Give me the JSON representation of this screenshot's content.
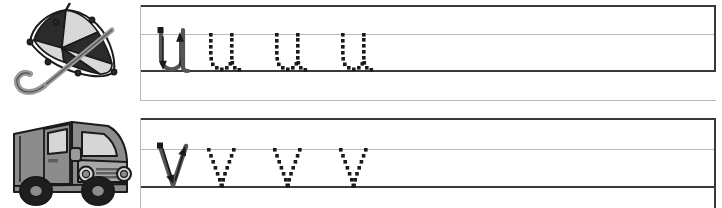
{
  "worksheet": {
    "title": "Lowercase letter tracing practice",
    "rows": [
      {
        "id": "row-u",
        "letter": "u",
        "picture": {
          "name": "umbrella",
          "label": "umbrella",
          "colors": {
            "panel_dark": "#2b2b2b",
            "panel_light": "#d8d8d8",
            "outline": "#1a1a1a",
            "handle": "#9a9a9a"
          }
        },
        "model_glyph": {
          "letter": "u",
          "style": "solid-with-stroke-arrows",
          "stroke_count": 2
        },
        "trace_glyphs": [
          {
            "letter": "u",
            "style": "dotted"
          },
          {
            "letter": "u",
            "style": "dotted"
          },
          {
            "letter": "u",
            "style": "dotted"
          }
        ],
        "rules": {
          "top": "solid-dark",
          "middle": "light-guide",
          "baseline": "solid-dark",
          "bottom": "light-guide"
        }
      },
      {
        "id": "row-v",
        "letter": "v",
        "picture": {
          "name": "van",
          "label": "van",
          "colors": {
            "body": "#8c8c8c",
            "body_light": "#a8a8a8",
            "window": "#d6d6d6",
            "outline": "#1a1a1a",
            "tire": "#1e1e1e",
            "hub": "#8c8c8c"
          }
        },
        "model_glyph": {
          "letter": "v",
          "style": "solid-with-stroke-arrows",
          "stroke_count": 2
        },
        "trace_glyphs": [
          {
            "letter": "v",
            "style": "dotted"
          },
          {
            "letter": "v",
            "style": "dotted"
          },
          {
            "letter": "v",
            "style": "dotted"
          }
        ],
        "rules": {
          "top": "solid-dark",
          "middle": "light-guide",
          "baseline": "solid-dark",
          "bottom": "light-guide"
        }
      }
    ],
    "colors": {
      "page_background": "#ffffff",
      "rule_dark": "#3a3a3a",
      "rule_light": "#b9b9b9",
      "ink": "#1a1a1a",
      "model_ink": "#555555"
    }
  }
}
